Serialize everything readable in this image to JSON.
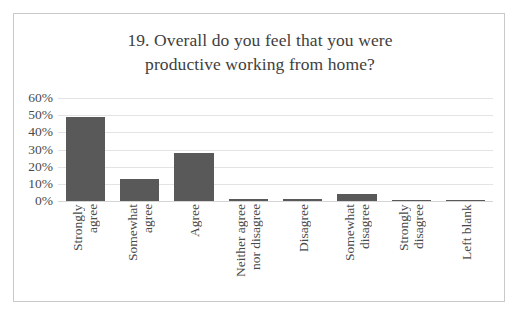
{
  "chart_data": {
    "type": "bar",
    "title": "19. Overall do you feel that you were productive working from home?",
    "title_line1": "19. Overall do you feel that you were",
    "title_line2": "productive working from home?",
    "xlabel": "",
    "ylabel": "",
    "ylim": [
      0,
      60
    ],
    "grid": true,
    "legend": "none",
    "bar_color": "#595959",
    "ytick_labels": [
      "60%",
      "50%",
      "40%",
      "30%",
      "20%",
      "10%",
      "0%"
    ],
    "ytick_values": [
      60,
      50,
      40,
      30,
      20,
      10,
      0
    ],
    "categories": [
      "Strongly agree",
      "Somewhat agree",
      "Agree",
      "Neither agree nor disagree",
      "Disagree",
      "Somewhat disagree",
      "Strongly disagree",
      "Left blank"
    ],
    "category_lines": [
      [
        "Strongly",
        "agree"
      ],
      [
        "Somewhat",
        "agree"
      ],
      [
        "Agree"
      ],
      [
        "Neither agree",
        "nor disagree"
      ],
      [
        "Disagree"
      ],
      [
        "Somewhat",
        "disagree"
      ],
      [
        "Strongly",
        "disagree"
      ],
      [
        "Left blank"
      ]
    ],
    "values": [
      49,
      13,
      28,
      1,
      1,
      4,
      0.6,
      0.6
    ]
  }
}
